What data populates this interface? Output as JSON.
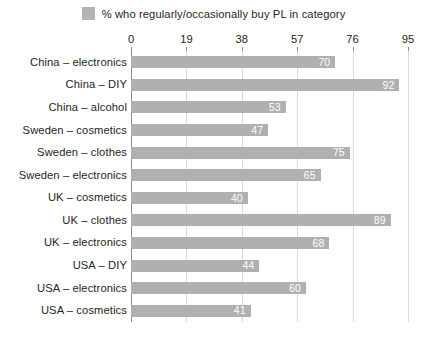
{
  "legend": {
    "label": "% who regularly/occasionally buy PL in category",
    "swatch_color": "#b4b4b4",
    "icon": "legend-swatch"
  },
  "colors": {
    "bar": "#b0b0b0",
    "gridline": "#d9d9d9",
    "axis": "#8c8c8c",
    "text": "#231f20",
    "value_label": "#ffffff"
  },
  "chart_data": {
    "type": "bar",
    "orientation": "horizontal",
    "title": "",
    "subtitle": "",
    "xlabel": "",
    "ylabel": "",
    "xlim": [
      0,
      95
    ],
    "ticks": [
      0,
      19,
      38,
      57,
      76,
      95
    ],
    "tick_labels": [
      "0",
      "19",
      "38",
      "57",
      "76",
      "95"
    ],
    "grid": true,
    "legend_position": "top-center",
    "series": [
      {
        "name": "% who regularly/occasionally buy PL in category",
        "values": [
          70,
          92,
          53,
          47,
          75,
          65,
          40,
          89,
          68,
          44,
          60,
          41
        ]
      }
    ],
    "categories": [
      "China – electronics",
      "China – DIY",
      "China – alcohol",
      "Sweden – cosmetics",
      "Sweden – clothes",
      "Sweden – electronics",
      "UK – cosmetics",
      "UK – clothes",
      "UK – electronics",
      "USA – DIY",
      "USA – electronics",
      "USA – cosmetics"
    ],
    "value_labels": [
      "70",
      "92",
      "53",
      "47",
      "75",
      "65",
      "40",
      "89",
      "68",
      "44",
      "60",
      "41"
    ]
  }
}
